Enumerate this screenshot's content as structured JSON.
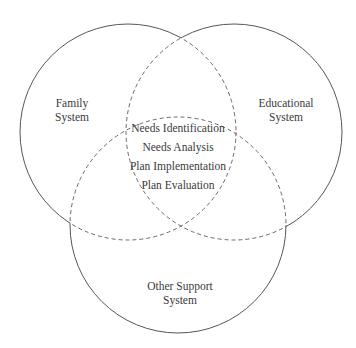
{
  "diagram": {
    "type": "venn",
    "sets": [
      {
        "id": "family",
        "label_line1": "Family",
        "label_line2": "System"
      },
      {
        "id": "educational",
        "label_line1": "Educational",
        "label_line2": "System"
      },
      {
        "id": "other",
        "label_line1": "Other Support",
        "label_line2": "System"
      }
    ],
    "intersection": {
      "items": [
        "Needs Identification",
        "Needs Analysis",
        "Plan Implementation",
        "Plan Evaluation"
      ]
    },
    "colors": {
      "stroke": "#555555",
      "text": "#3a3a3a",
      "background": "#ffffff"
    }
  }
}
